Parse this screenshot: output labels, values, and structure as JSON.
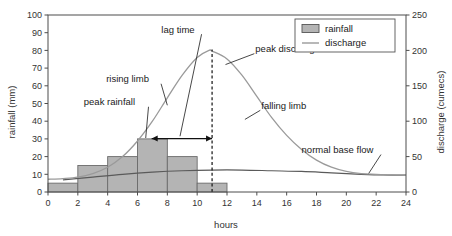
{
  "chart_data": {
    "type": "bar",
    "title": "",
    "subtitle": "",
    "xlabel": "hours",
    "ylabel": "rainfall (mm)",
    "y2label": "discharge (cumecs)",
    "xlim": [
      0,
      24
    ],
    "ylim": [
      0,
      100
    ],
    "y2lim": [
      0,
      250
    ],
    "grid": false,
    "legend_position": "top-right",
    "x_ticks": [
      0,
      2,
      4,
      6,
      8,
      10,
      12,
      14,
      16,
      18,
      20,
      22,
      24
    ],
    "y_ticks": [
      0,
      10,
      20,
      30,
      40,
      50,
      60,
      70,
      80,
      90,
      100
    ],
    "y2_ticks": [
      0,
      50,
      100,
      150,
      200,
      250
    ],
    "legend": [
      {
        "label": "rainfall",
        "marker": "swatch",
        "color": "#b4b4b4"
      },
      {
        "label": "discharge",
        "marker": "line",
        "color": "#9a9a9a"
      }
    ],
    "series": [
      {
        "name": "rainfall",
        "type": "bar",
        "axis": "left",
        "unit": "mm",
        "bin_width": 2,
        "bins": [
          {
            "x_start": 0,
            "x_end": 2,
            "value": 5
          },
          {
            "x_start": 2,
            "x_end": 4,
            "value": 15
          },
          {
            "x_start": 4,
            "x_end": 6,
            "value": 20
          },
          {
            "x_start": 6,
            "x_end": 8,
            "value": 30
          },
          {
            "x_start": 8,
            "x_end": 10,
            "value": 20
          },
          {
            "x_start": 10,
            "x_end": 12,
            "value": 5
          }
        ]
      },
      {
        "name": "discharge",
        "type": "line",
        "axis": "right",
        "unit": "cumecs",
        "points": [
          {
            "x": 0,
            "y": 18
          },
          {
            "x": 1,
            "y": 19
          },
          {
            "x": 2,
            "y": 21
          },
          {
            "x": 3,
            "y": 26
          },
          {
            "x": 4,
            "y": 35
          },
          {
            "x": 5,
            "y": 50
          },
          {
            "x": 6,
            "y": 72
          },
          {
            "x": 7,
            "y": 100
          },
          {
            "x": 8,
            "y": 133
          },
          {
            "x": 9,
            "y": 165
          },
          {
            "x": 10,
            "y": 190
          },
          {
            "x": 10.8,
            "y": 200
          },
          {
            "x": 11,
            "y": 199
          },
          {
            "x": 12,
            "y": 188
          },
          {
            "x": 13,
            "y": 165
          },
          {
            "x": 14,
            "y": 135
          },
          {
            "x": 15,
            "y": 105
          },
          {
            "x": 16,
            "y": 80
          },
          {
            "x": 17,
            "y": 60
          },
          {
            "x": 18,
            "y": 45
          },
          {
            "x": 19,
            "y": 35
          },
          {
            "x": 20,
            "y": 29
          },
          {
            "x": 21,
            "y": 26
          },
          {
            "x": 22,
            "y": 25
          },
          {
            "x": 23,
            "y": 24
          },
          {
            "x": 24,
            "y": 24
          }
        ]
      },
      {
        "name": "normal base flow",
        "type": "line",
        "axis": "right",
        "unit": "cumecs",
        "points": [
          {
            "x": 1,
            "y": 17
          },
          {
            "x": 3,
            "y": 21
          },
          {
            "x": 5,
            "y": 25
          },
          {
            "x": 7,
            "y": 28
          },
          {
            "x": 9,
            "y": 30
          },
          {
            "x": 11,
            "y": 31
          },
          {
            "x": 13,
            "y": 31
          },
          {
            "x": 15,
            "y": 30
          },
          {
            "x": 17,
            "y": 29
          },
          {
            "x": 19,
            "y": 27
          },
          {
            "x": 21,
            "y": 25
          },
          {
            "x": 22.5,
            "y": 24
          },
          {
            "x": 24,
            "y": 24
          }
        ]
      }
    ],
    "annotations": [
      {
        "id": "peak-rainfall",
        "label": "peak rainfall",
        "text_x": 2.4,
        "text_y": 49,
        "target_x": 6.55,
        "target_y": 30.5
      },
      {
        "id": "rising-limb",
        "label": "rising limb",
        "text_x": 3.9,
        "text_y": 62,
        "target_x": 8.0,
        "target_y": 49
      },
      {
        "id": "lag-time",
        "label": "lag time",
        "text_x": 7.6,
        "text_y": 90,
        "target_x": 8.85,
        "target_y": 31.5
      },
      {
        "id": "peak-discharge",
        "label": "peak discharge",
        "text_x": 13.9,
        "text_y": 79,
        "target_x": 11.9,
        "target_y": 72
      },
      {
        "id": "falling-limb",
        "label": "falling limb",
        "text_x": 14.3,
        "text_y": 47,
        "target_x": 13.2,
        "target_y": 41
      },
      {
        "id": "normal-base-flow",
        "label": "normal base flow",
        "text_x": 17.0,
        "text_y": 22,
        "target_x": 21.5,
        "target_y": 10.5
      },
      {
        "id": "lag-time-span",
        "label": "",
        "from_x": 6.95,
        "to_x": 11.0,
        "at_y": 30.2,
        "double_headed": true
      },
      {
        "id": "peak-marker",
        "label": "",
        "x": 11.0,
        "from_y": 0,
        "to_y": 80.5,
        "style": "dashed"
      }
    ]
  }
}
